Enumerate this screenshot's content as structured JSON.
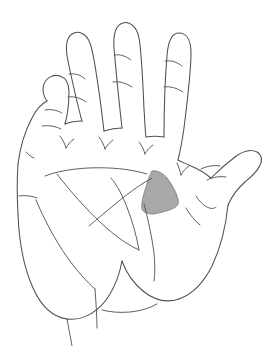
{
  "figure": {
    "background_color": "#ffffff",
    "stroke_color": "#4f4f55",
    "highlight_color": "#a8a8a8",
    "highlight_stroke_color": "#7a7a7e",
    "view_box": "0 0 273 346",
    "width": 273,
    "height": 346
  },
  "regions": {
    "highlight": {
      "name": "first-web-space-shaded-region",
      "label": "",
      "fill": "#a8a8a8",
      "path": "M152 171 C157 170 163 173 167 178 C172 184 176 192 178 199 C179 203 178 206 174 208 C168 211 160 213 153 214 C147 214 143 212 142 209 C141 204 143 196 146 187 C148 180 150 174 152 171 Z"
    }
  },
  "outline": {
    "name": "hand-outline",
    "segments": [
      "M18 164 C20 148 25 131 32 118 C36 110 41 104 47 101",
      "M47 101 C43 96 42 89 44 84 C47 77 54 74 60 76 C66 78 69 84 69 92 C69 101 68 113 65 124",
      "M65 124 C70 122 76 121 82 121",
      "M82 121 C78 107 72 80 68 61 C65 47 66 38 72 34 C78 30 86 33 90 43 C93 51 97 77 100 99 C102 113 103 124 104 131",
      "M104 131 C110 129 116 128 122 128",
      "M122 128 C120 110 116 72 114 48 C113 34 116 25 123 23 C130 21 137 27 139 38 C141 49 143 85 144 109 C145 122 145 131 146 137",
      "M146 137 C152 136 158 136 164 137",
      "M164 137 C164 118 165 80 167 56 C168 42 172 33 179 33 C187 33 191 41 191 53 C191 66 187 104 184 128 C182 142 180 152 178 160",
      "M18 164 C17 178 17 196 18 214",
      "M18 214 C19 241 24 268 33 288 C41 306 53 317 67 319",
      "M67 319 C84 321 100 311 110 294 C116 284 120 272 122 261",
      "M122 261 C126 272 133 283 143 291 C154 300 167 303 179 299",
      "M179 299 C193 294 204 282 212 266 C221 247 226 225 228 205",
      "M228 205 C232 196 238 188 245 182 C252 176 257 172 259 167",
      "M259 167 C263 161 262 155 257 152 C251 149 243 151 235 157",
      "M235 157 C227 163 218 171 211 178",
      "M211 178 C205 173 198 169 191 166 C185 163 181 162 178 160"
    ]
  },
  "creases": {
    "name": "skin-creases",
    "segments": [
      "M45 110 C51 109 57 110 62 113",
      "M42 126 C48 125 55 126 61 129",
      "M69 74 C75 73 81 75 85 79",
      "M68 97 C74 96 81 98 86 102",
      "M114 55 C120 54 126 56 131 60",
      "M113 82 C119 81 126 83 132 87",
      "M165 61 C171 60 177 62 182 66",
      "M164 87 C170 86 177 88 183 92",
      "M60 136 C63 140 65 144 66 148",
      "M66 148 C68 144 71 141 74 139",
      "M99 137 C102 141 104 145 105 149",
      "M105 149 C107 145 110 142 113 140",
      "M139 142 C142 146 144 150 145 154",
      "M145 154 C147 150 150 147 153 145",
      "M177 163 C179 167 180 171 181 175",
      "M181 175 C183 171 186 168 189 166",
      "M26 152 C29 155 31 157 34 158",
      "M19 196 C26 195 32 196 37 198",
      "M45 176 C55 172 70 169 88 168 C110 167 131 169 147 174",
      "M36 200 C44 219 55 240 67 257 C77 271 87 282 95 289",
      "M57 174 C70 191 86 209 101 223 C115 236 128 245 139 250",
      "M139 250 C137 238 133 223 128 210 C123 196 117 185 111 178",
      "M89 226 C97 219 108 210 119 201 C131 191 143 183 152 178",
      "M144 204 C148 219 152 237 154 253 C155 265 155 274 154 281",
      "M196 196 C199 201 203 205 207 207 C211 209 214 209 216 207",
      "M186 208 C190 215 195 221 200 225",
      "M201 169 C207 166 214 165 220 166",
      "M207 180 C213 177 220 176 226 177",
      "M102 310 C110 312 120 313 130 312 C141 311 150 308 157 304",
      "M67 319 C69 330 71 340 72 346",
      "M95 289 C96 303 97 317 97 328"
    ]
  },
  "annotations": {
    "figure_label": "",
    "caption": ""
  }
}
